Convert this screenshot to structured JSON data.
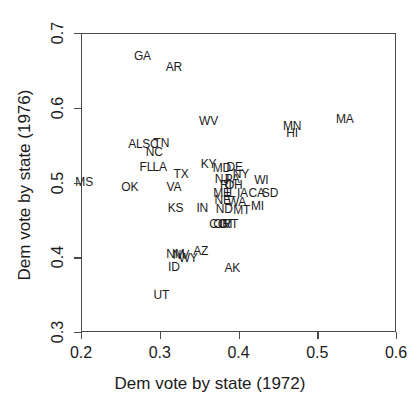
{
  "chart_data": {
    "type": "scatter",
    "title": "",
    "xlabel": "Dem vote by state (1972)",
    "ylabel": "Dem vote by state (1976)",
    "xlim": [
      0.2,
      0.6
    ],
    "ylim": [
      0.3,
      0.7
    ],
    "xticks": [
      "0.2",
      "0.3",
      "0.4",
      "0.5",
      "0.6"
    ],
    "yticks": [
      "0.3",
      "0.4",
      "0.5",
      "0.6",
      "0.7"
    ],
    "xtick_values": [
      0.2,
      0.3,
      0.4,
      0.5,
      0.6
    ],
    "ytick_values": [
      0.3,
      0.4,
      0.5,
      0.6,
      0.7
    ],
    "grid": false,
    "legend": "none",
    "marker_style": "text-label",
    "point_label_field": "state",
    "points": [
      {
        "state": "GA",
        "x": 0.278,
        "y": 0.669
      },
      {
        "state": "AR",
        "x": 0.318,
        "y": 0.654
      },
      {
        "state": "WV",
        "x": 0.362,
        "y": 0.582
      },
      {
        "state": "MA",
        "x": 0.535,
        "y": 0.585
      },
      {
        "state": "MN",
        "x": 0.468,
        "y": 0.576
      },
      {
        "state": "HI",
        "x": 0.468,
        "y": 0.566
      },
      {
        "state": "AL",
        "x": 0.269,
        "y": 0.552
      },
      {
        "state": "SC",
        "x": 0.288,
        "y": 0.552
      },
      {
        "state": "TN",
        "x": 0.302,
        "y": 0.553
      },
      {
        "state": "NC",
        "x": 0.293,
        "y": 0.541
      },
      {
        "state": "FL",
        "x": 0.283,
        "y": 0.521
      },
      {
        "state": "LA",
        "x": 0.3,
        "y": 0.521
      },
      {
        "state": "TX",
        "x": 0.327,
        "y": 0.512
      },
      {
        "state": "KY",
        "x": 0.362,
        "y": 0.525
      },
      {
        "state": "MD",
        "x": 0.379,
        "y": 0.52
      },
      {
        "state": "DE",
        "x": 0.395,
        "y": 0.521
      },
      {
        "state": "NY",
        "x": 0.403,
        "y": 0.512
      },
      {
        "state": "NJ",
        "x": 0.379,
        "y": 0.505
      },
      {
        "state": "PA",
        "x": 0.392,
        "y": 0.505
      },
      {
        "state": "RI",
        "x": 0.384,
        "y": 0.496
      },
      {
        "state": "OH",
        "x": 0.394,
        "y": 0.496
      },
      {
        "state": "MS",
        "x": 0.204,
        "y": 0.501
      },
      {
        "state": "OK",
        "x": 0.262,
        "y": 0.494
      },
      {
        "state": "VA",
        "x": 0.318,
        "y": 0.494
      },
      {
        "state": "ME",
        "x": 0.379,
        "y": 0.486
      },
      {
        "state": "IL",
        "x": 0.39,
        "y": 0.486
      },
      {
        "state": "IA",
        "x": 0.405,
        "y": 0.486
      },
      {
        "state": "CA",
        "x": 0.423,
        "y": 0.486
      },
      {
        "state": "SD",
        "x": 0.44,
        "y": 0.486
      },
      {
        "state": "NE",
        "x": 0.38,
        "y": 0.477
      },
      {
        "state": "WI",
        "x": 0.429,
        "y": 0.503
      },
      {
        "state": "WA",
        "x": 0.398,
        "y": 0.474
      },
      {
        "state": "MI",
        "x": 0.424,
        "y": 0.468
      },
      {
        "state": "KS",
        "x": 0.32,
        "y": 0.466
      },
      {
        "state": "IN",
        "x": 0.354,
        "y": 0.466
      },
      {
        "state": "ND",
        "x": 0.382,
        "y": 0.464
      },
      {
        "state": "MT",
        "x": 0.404,
        "y": 0.463
      },
      {
        "state": "CO",
        "x": 0.374,
        "y": 0.445
      },
      {
        "state": "OR",
        "x": 0.379,
        "y": 0.445
      },
      {
        "state": "CT",
        "x": 0.385,
        "y": 0.445
      },
      {
        "state": "VT",
        "x": 0.39,
        "y": 0.445
      },
      {
        "state": "NM",
        "x": 0.32,
        "y": 0.405
      },
      {
        "state": "NV",
        "x": 0.327,
        "y": 0.403
      },
      {
        "state": "WY",
        "x": 0.336,
        "y": 0.399
      },
      {
        "state": "AZ",
        "x": 0.352,
        "y": 0.408
      },
      {
        "state": "ID",
        "x": 0.318,
        "y": 0.387
      },
      {
        "state": "AK",
        "x": 0.392,
        "y": 0.385
      },
      {
        "state": "UT",
        "x": 0.302,
        "y": 0.349
      }
    ]
  },
  "axes": {
    "x_title": "Dem vote by state (1972)",
    "y_title": "Dem vote by state (1976)"
  }
}
